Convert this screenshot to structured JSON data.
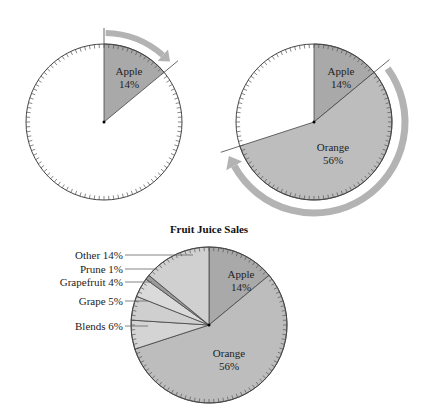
{
  "title": "Fruit Juice Sales",
  "colors": {
    "apple": "#a9a9a9",
    "orange": "#bdbdbd",
    "blends": "#d4d4d4",
    "grape": "#cfcfcf",
    "grapefruit": "#dadada",
    "prune": "#9a9a9a",
    "other": "#d0d0d0",
    "arrow": "#b3b3b3",
    "stroke": "#444444"
  },
  "step1": {
    "slices": [
      {
        "label": "Apple",
        "pct": "14%"
      }
    ]
  },
  "step2": {
    "slices": [
      {
        "label": "Apple",
        "pct": "14%"
      },
      {
        "label": "Orange",
        "pct": "56%"
      }
    ]
  },
  "final": {
    "labels": {
      "apple": "Apple",
      "apple_pct": "14%",
      "orange": "Orange",
      "orange_pct": "56%",
      "other": "Other 14%",
      "prune": "Prune 1%",
      "grapefruit": "Grapefruit 4%",
      "grape": "Grape 5%",
      "blends": "Blends 6%"
    }
  },
  "chart_data": {
    "type": "pie",
    "title": "Fruit Juice Sales",
    "categories": [
      "Apple",
      "Orange",
      "Blends",
      "Grape",
      "Grapefruit",
      "Prune",
      "Other"
    ],
    "values": [
      14,
      56,
      6,
      5,
      4,
      1,
      14
    ],
    "unit": "%",
    "start_angle_deg": 0,
    "direction": "clockwise",
    "tick_marks": 100,
    "steps": [
      {
        "shown": [
          "Apple"
        ],
        "values": [
          14
        ]
      },
      {
        "shown": [
          "Apple",
          "Orange"
        ],
        "values": [
          14,
          56
        ]
      },
      {
        "shown": [
          "Apple",
          "Orange",
          "Blends",
          "Grape",
          "Grapefruit",
          "Prune",
          "Other"
        ],
        "values": [
          14,
          56,
          6,
          5,
          4,
          1,
          14
        ]
      }
    ]
  }
}
